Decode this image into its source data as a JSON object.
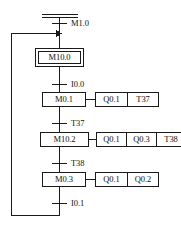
{
  "diagram": {
    "type": "sequential-function-chart",
    "title": "",
    "colors": {
      "line": "#1a1a1a",
      "text": "#111111",
      "background": "#ffffff"
    },
    "initial_step": {
      "label": "M10.0",
      "kind": "initial-step",
      "actions": []
    },
    "steps": [
      {
        "label": "M0.1",
        "kind": "step",
        "actions": [
          "Q0.1",
          "T37"
        ]
      },
      {
        "label": "M10.2",
        "kind": "step",
        "actions": [
          "Q0.1",
          "Q0.3",
          "T38"
        ]
      },
      {
        "label": "M0.3",
        "kind": "step",
        "actions": [
          "Q0.1",
          "Q0.2"
        ]
      }
    ],
    "transitions": [
      {
        "label": "M1.0",
        "position": "top"
      },
      {
        "label": "I0.0",
        "position": "after-initial-step"
      },
      {
        "label": "T37",
        "position": "after-step-1"
      },
      {
        "label": "T38",
        "position": "after-step-2"
      },
      {
        "label": "I0.1",
        "position": "after-step-3"
      }
    ],
    "return_branch": {
      "from": "I0.1",
      "to": "M1.0",
      "direction": "left-up-right",
      "arrow": "right"
    }
  }
}
